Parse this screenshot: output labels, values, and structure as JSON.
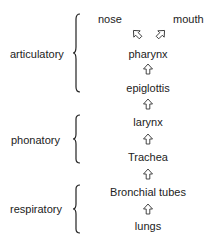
{
  "diagram": {
    "groups": [
      {
        "label": "articulatory"
      },
      {
        "label": "phonatory"
      },
      {
        "label": "respiratory"
      }
    ],
    "nodes": {
      "nose": "nose",
      "mouth": "mouth",
      "pharynx": "pharynx",
      "epiglottis": "epiglottis",
      "larynx": "larynx",
      "trachea": "Trachea",
      "bronchial_tubes": "Bronchial tubes",
      "lungs": "lungs"
    }
  }
}
